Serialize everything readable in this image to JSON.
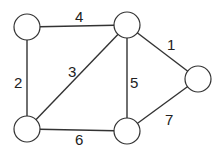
{
  "graph": {
    "nodes": [
      {
        "id": "A",
        "x": 27,
        "y": 27
      },
      {
        "id": "B",
        "x": 127,
        "y": 25
      },
      {
        "id": "C",
        "x": 198,
        "y": 79
      },
      {
        "id": "D",
        "x": 27,
        "y": 129
      },
      {
        "id": "E",
        "x": 127,
        "y": 131
      }
    ],
    "edges": [
      {
        "from": "A",
        "to": "B",
        "weight": "4"
      },
      {
        "from": "A",
        "to": "D",
        "weight": "2"
      },
      {
        "from": "B",
        "to": "D",
        "weight": "3"
      },
      {
        "from": "B",
        "to": "E",
        "weight": "5"
      },
      {
        "from": "B",
        "to": "C",
        "weight": "1"
      },
      {
        "from": "D",
        "to": "E",
        "weight": "6"
      },
      {
        "from": "E",
        "to": "C",
        "weight": "7"
      }
    ],
    "colors": {
      "stroke": "#333333",
      "fill": "#ffffff",
      "text": "#222222"
    }
  }
}
